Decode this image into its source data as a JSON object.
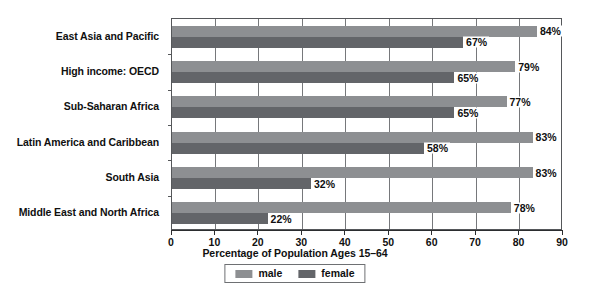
{
  "chart_data": {
    "type": "bar",
    "orientation": "horizontal",
    "title": "",
    "xlabel": "Percentage of Population Ages 15–64",
    "ylabel": "",
    "xlim": [
      0,
      90
    ],
    "xticks": [
      0,
      10,
      20,
      30,
      40,
      50,
      60,
      70,
      80,
      90
    ],
    "xtick_labels": [
      "0",
      "10",
      "20",
      "30",
      "40",
      "50",
      "60",
      "70",
      "80",
      "90"
    ],
    "grid": true,
    "grid_axis": "x",
    "legend_position": "bottom",
    "categories": [
      "East Asia and Pacific",
      "High income: OECD",
      "Sub-Saharan Africa",
      "Latin America and Caribbean",
      "South Asia",
      "Middle East and North Africa"
    ],
    "series": [
      {
        "name": "male",
        "color": "#8d8f92",
        "values": [
          84,
          79,
          77,
          83,
          83,
          78
        ],
        "labels": [
          "84%",
          "79%",
          "77%",
          "83%",
          "83%",
          "78%"
        ]
      },
      {
        "name": "female",
        "color": "#636569",
        "values": [
          67,
          65,
          65,
          58,
          32,
          22
        ],
        "labels": [
          "67%",
          "65%",
          "65%",
          "58%",
          "32%",
          "22%"
        ]
      }
    ]
  },
  "legend": {
    "items": [
      {
        "label": "male",
        "color": "#8d8f92"
      },
      {
        "label": "female",
        "color": "#636569"
      }
    ]
  }
}
